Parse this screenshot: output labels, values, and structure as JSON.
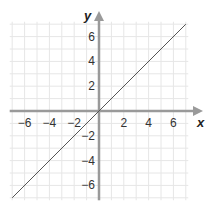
{
  "chart_data": {
    "type": "line",
    "title": "",
    "xlabel": "x",
    "ylabel": "y",
    "xlim": [
      -7,
      7
    ],
    "ylim": [
      -7,
      7
    ],
    "grid": true,
    "xticks": [
      -6,
      -4,
      -2,
      2,
      4,
      6
    ],
    "yticks": [
      -6,
      -4,
      -2,
      2,
      4,
      6
    ],
    "xtick_labels": [
      "−6",
      "−4",
      "−2",
      "2",
      "4",
      "6"
    ],
    "ytick_labels": [
      "−6",
      "−4",
      "−2",
      "2",
      "4",
      "6"
    ],
    "series": [
      {
        "name": "y = x",
        "x": [
          -7,
          7
        ],
        "y": [
          -7,
          7
        ]
      }
    ]
  },
  "colors": {
    "grid": "#e6e6e6",
    "axis": "#9a9a9a",
    "line": "#555555"
  }
}
